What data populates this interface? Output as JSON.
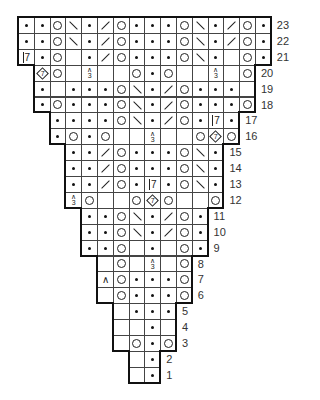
{
  "grid": {
    "left": 18,
    "top": 17,
    "cell_w": 15.8,
    "cell_h": 15.9,
    "columns": 16,
    "row_label_color": "#333333",
    "legend": {
      "dot": "purl",
      "yo": "yarn over",
      "bslash": "ssk (left-leaning decrease)",
      "fslash": "k2tog (right-leaning decrease)",
      "dec3": "centered double decrease (3 into 1)",
      "k7": "7-stitch cluster",
      "dia7": "7-stitch increase (diamond)",
      "caret": "decrease",
      "blank": "knit"
    }
  },
  "rows": [
    {
      "num": "23",
      "start": 1,
      "cells": [
        "dot",
        "dot",
        "yo",
        "bslash",
        "dot",
        "fslash",
        "yo",
        "dot",
        "dot",
        "dot",
        "yo",
        "bslash",
        "dot",
        "fslash",
        "yo",
        "dot"
      ]
    },
    {
      "num": "22",
      "start": 1,
      "cells": [
        "dot",
        "dot",
        "yo",
        "bslash",
        "dot",
        "fslash",
        "yo",
        "dot",
        "dot",
        "dot",
        "yo",
        "bslash",
        "dot",
        "fslash",
        "yo",
        "dot"
      ]
    },
    {
      "num": "21",
      "start": 1,
      "cells": [
        "k7",
        "dot",
        "yo",
        "blank",
        "dot",
        "fslash",
        "yo",
        "dot",
        "dot",
        "dot",
        "yo",
        "bslash",
        "dot",
        "blank",
        "yo",
        "dot"
      ]
    },
    {
      "num": "20",
      "start": 2,
      "cells": [
        "dia7",
        "yo",
        "blank",
        "dec3",
        "blank",
        "blank",
        "yo",
        "dot",
        "yo",
        "blank",
        "blank",
        "dec3",
        "blank",
        "yo"
      ]
    },
    {
      "num": "19",
      "start": 2,
      "cells": [
        "dot",
        "blank",
        "dot",
        "dot",
        "dot",
        "yo",
        "bslash",
        "dot",
        "fslash",
        "yo",
        "dot",
        "dot",
        "dot",
        "blank"
      ]
    },
    {
      "num": "18",
      "start": 2,
      "cells": [
        "dot",
        "yo",
        "dot",
        "dot",
        "dot",
        "yo",
        "bslash",
        "dot",
        "fslash",
        "yo",
        "dot",
        "dot",
        "dot",
        "yo"
      ]
    },
    {
      "num": "17",
      "start": 3,
      "cells": [
        "dot",
        "dot",
        "dot",
        "dot",
        "yo",
        "bslash",
        "dot",
        "fslash",
        "yo",
        "dot",
        "k7",
        "dot"
      ]
    },
    {
      "num": "16",
      "start": 3,
      "cells": [
        "dot",
        "yo",
        "dot",
        "yo",
        "blank",
        "blank",
        "dec3",
        "blank",
        "blank",
        "yo",
        "dia7",
        "yo"
      ]
    },
    {
      "num": "15",
      "start": 4,
      "cells": [
        "dot",
        "dot",
        "fslash",
        "yo",
        "dot",
        "dot",
        "dot",
        "yo",
        "bslash",
        "dot"
      ]
    },
    {
      "num": "14",
      "start": 4,
      "cells": [
        "dot",
        "dot",
        "fslash",
        "yo",
        "dot",
        "dot",
        "dot",
        "yo",
        "bslash",
        "dot"
      ]
    },
    {
      "num": "13",
      "start": 4,
      "cells": [
        "dot",
        "dot",
        "fslash",
        "yo",
        "dot",
        "k7",
        "dot",
        "yo",
        "bslash",
        "dot"
      ]
    },
    {
      "num": "12",
      "start": 4,
      "cells": [
        "dec3",
        "yo",
        "blank",
        "blank",
        "yo",
        "dia7",
        "yo",
        "blank",
        "blank",
        "yo"
      ]
    },
    {
      "num": "11",
      "start": 5,
      "cells": [
        "dot",
        "dot",
        "yo",
        "bslash",
        "dot",
        "fslash",
        "yo",
        "dot"
      ]
    },
    {
      "num": "10",
      "start": 5,
      "cells": [
        "dot",
        "dot",
        "yo",
        "bslash",
        "dot",
        "fslash",
        "yo",
        "dot"
      ]
    },
    {
      "num": "9",
      "start": 5,
      "cells": [
        "dot",
        "dot",
        "yo",
        "blank",
        "dot",
        "blank",
        "yo",
        "dot"
      ]
    },
    {
      "num": "8",
      "start": 6,
      "cells": [
        "blank",
        "yo",
        "blank",
        "dec3",
        "blank",
        "yo"
      ]
    },
    {
      "num": "7",
      "start": 6,
      "cells": [
        "caret",
        "yo",
        "dot",
        "dot",
        "dot",
        "yo"
      ]
    },
    {
      "num": "6",
      "start": 6,
      "cells": [
        "blank",
        "yo",
        "dot",
        "dot",
        "dot",
        "yo"
      ]
    },
    {
      "num": "5",
      "start": 7,
      "cells": [
        "blank",
        "dot",
        "dot",
        "dot"
      ]
    },
    {
      "num": "4",
      "start": 7,
      "cells": [
        "blank",
        "blank",
        "dot",
        "blank"
      ]
    },
    {
      "num": "3",
      "start": 7,
      "cells": [
        "blank",
        "yo",
        "dot",
        "yo"
      ]
    },
    {
      "num": "2",
      "start": 8,
      "cells": [
        "blank",
        "dot"
      ]
    },
    {
      "num": "1",
      "start": 8,
      "cells": [
        "blank",
        "dot"
      ]
    }
  ],
  "symbols": {
    "k7_text": "7",
    "dia7_text": "7",
    "dec3_top": "∧",
    "dec3_bottom": "3",
    "caret_text": "∧"
  }
}
